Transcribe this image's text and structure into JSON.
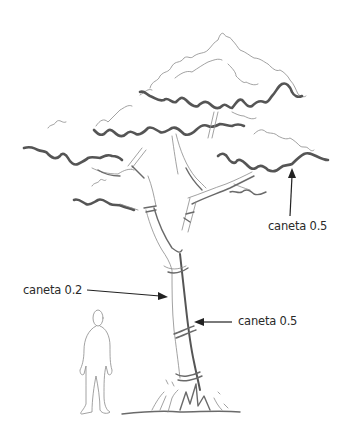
{
  "illustration": {
    "subject": "tree sketch with human scale figure",
    "colors": {
      "background": "#ffffff",
      "ink_thick": "#555555",
      "ink_thin": "#8a8a8a",
      "text": "#2a2a2a"
    }
  },
  "annotations": [
    {
      "id": "canopy-outline",
      "text": "caneta 0.5"
    },
    {
      "id": "trunk-left",
      "text": "caneta 0.2"
    },
    {
      "id": "trunk-right",
      "text": "caneta 0.5"
    }
  ]
}
